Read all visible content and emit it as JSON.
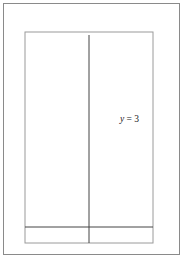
{
  "chart_data": {
    "type": "line",
    "title": "",
    "xlabel": "x",
    "ylabel": "y",
    "xlim": [
      -4,
      4
    ],
    "ylim": [
      -1,
      12
    ],
    "grid": true,
    "x_ticks": [
      "-3",
      "-2",
      "-1",
      "1",
      "2",
      "3"
    ],
    "y_ticks": [
      "1",
      "2",
      "3",
      "4",
      "5",
      "6",
      "7",
      "8",
      "9",
      "10"
    ],
    "series": [
      {
        "name": "y = 3^x",
        "label": "y = 3",
        "label_exponent": "x",
        "function": "3^x",
        "x": [
          -3,
          -2,
          -1,
          0,
          0.5,
          1,
          1.5,
          2,
          2.26
        ],
        "values": [
          0.037,
          0.111,
          0.333,
          1,
          1.732,
          3,
          5.196,
          9,
          12
        ]
      }
    ],
    "annotations": [
      {
        "text": "y = 3^x",
        "x": 1.6,
        "y": 6.5
      }
    ]
  },
  "axes": {
    "x_label": "x",
    "y_label": "y"
  },
  "colors": {
    "curve": "#333333",
    "axis": "#444444",
    "grid": "#d0d0d0",
    "frame": "#8a8a8a"
  }
}
